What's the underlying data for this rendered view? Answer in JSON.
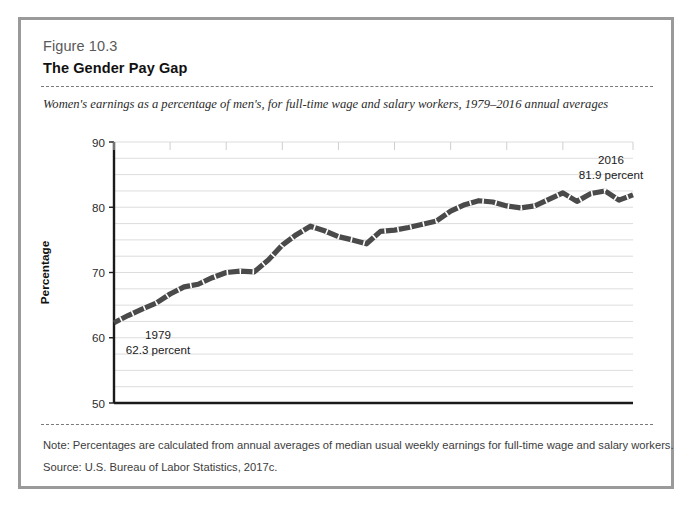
{
  "figure": {
    "label": "Figure 10.3",
    "title": "The Gender Pay Gap",
    "subtitle": "Women's earnings as a percentage of men's, for full-time wage and salary workers, 1979–2016 annual averages",
    "note": "Note: Percentages are calculated from annual averages of median usual weekly earnings for full-time wage and salary workers.",
    "source": "Source: U.S. Bureau of Labor Statistics, 2017c.",
    "border_color": "#9a9a9a",
    "rule_color": "#7a7a7a"
  },
  "chart_data": {
    "type": "line",
    "title": "The Gender Pay Gap",
    "subtitle": "Women's earnings as a percentage of men's, for full-time wage and salary workers, 1979–2016 annual averages",
    "xlabel": "",
    "ylabel": "Percentage",
    "xlim": [
      1979,
      2016
    ],
    "ylim": [
      50,
      90
    ],
    "yticks": [
      50,
      60,
      70,
      80,
      90
    ],
    "ytick_labels": [
      "50",
      "60",
      "70",
      "80",
      "90"
    ],
    "y_gridlines": [
      52.5,
      55,
      57.5,
      60,
      62.5,
      65,
      67.5,
      70,
      72.5,
      75,
      77.5,
      80,
      82.5,
      85,
      87.5,
      90
    ],
    "xticks": [
      1979,
      1983,
      1987,
      1991,
      1995,
      1999,
      2003,
      2007,
      2011,
      2016
    ],
    "xtick_labels": [
      "1979",
      "1983",
      "1987",
      "1991",
      "1995",
      "1999",
      "2003",
      "2007",
      "2011",
      "2016"
    ],
    "grid": "horizontal",
    "legend": "none",
    "line_color": "#4a4a4a",
    "line_style": "dashed-thick",
    "x": [
      1979,
      1980,
      1981,
      1982,
      1983,
      1984,
      1985,
      1986,
      1987,
      1988,
      1989,
      1990,
      1991,
      1992,
      1993,
      1994,
      1995,
      1996,
      1997,
      1998,
      1999,
      2000,
      2001,
      2002,
      2003,
      2004,
      2005,
      2006,
      2007,
      2008,
      2009,
      2010,
      2011,
      2012,
      2013,
      2014,
      2015,
      2016
    ],
    "values": [
      62.3,
      63.4,
      64.4,
      65.3,
      66.7,
      67.8,
      68.2,
      69.2,
      70.0,
      70.2,
      70.1,
      71.9,
      74.2,
      75.8,
      77.1,
      76.4,
      75.5,
      75.0,
      74.4,
      76.3,
      76.5,
      76.9,
      77.4,
      77.9,
      79.4,
      80.4,
      81.0,
      80.8,
      80.2,
      79.9,
      80.2,
      81.2,
      82.2,
      80.9,
      82.1,
      82.5,
      81.1,
      81.9
    ],
    "annotations": [
      {
        "name": "start-annotation",
        "year": 1979,
        "value": 62.3,
        "line1": "1979",
        "line2": "62.3 percent"
      },
      {
        "name": "end-annotation",
        "year": 2016,
        "value": 81.9,
        "line1": "2016",
        "line2": "81.9 percent"
      }
    ]
  }
}
